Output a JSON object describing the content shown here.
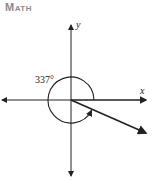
{
  "header": {
    "title": "Math"
  },
  "diagram": {
    "x_axis_label": "x",
    "y_axis_label": "y",
    "angle_label": "337°",
    "angle_degrees": 337,
    "colors": {
      "line": "#222222",
      "header": "#8a8a8a"
    }
  }
}
